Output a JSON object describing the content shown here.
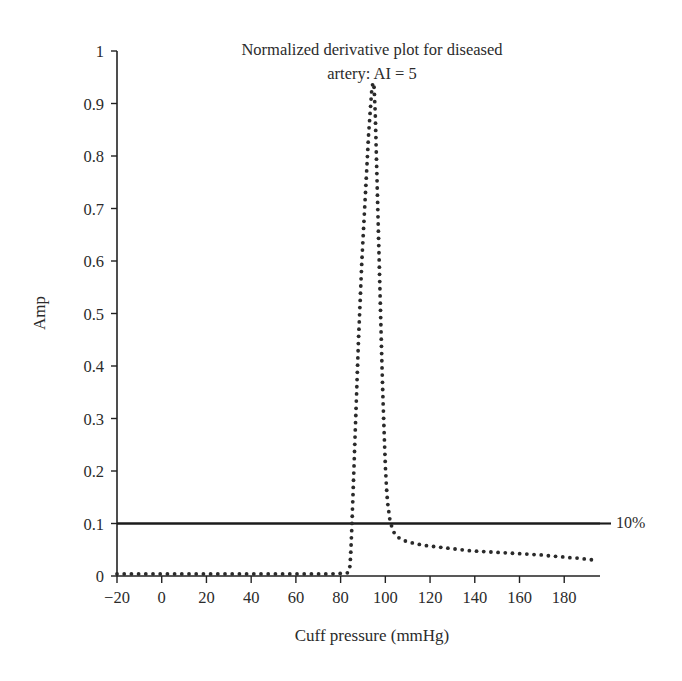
{
  "figure": {
    "background": "#ffffff",
    "ink_color": "#2b2b2b"
  },
  "title": {
    "line1": "Normalized derivative plot for diseased",
    "line2": "artery: AI = 5"
  },
  "axes": {
    "x_label": "Cuff pressure (mmHg)",
    "y_label": "Amp"
  },
  "annotation": {
    "threshold_label": "10%"
  },
  "chart_data": {
    "type": "line",
    "title": "Normalized derivative plot for diseased artery: AI = 5",
    "xlabel": "Cuff pressure (mmHg)",
    "ylabel": "Amp",
    "xlim": [
      -20,
      196
    ],
    "ylim": [
      0,
      1
    ],
    "xticks": [
      -20,
      0,
      20,
      40,
      60,
      80,
      100,
      120,
      140,
      160,
      180
    ],
    "xtick_labels": [
      "−20",
      "0",
      "20",
      "40",
      "60",
      "80",
      "100",
      "120",
      "140",
      "160",
      "180"
    ],
    "yticks": [
      0,
      0.1,
      0.2,
      0.3,
      0.4,
      0.5,
      0.6,
      0.7,
      0.8,
      0.9,
      1
    ],
    "ytick_labels": [
      "0",
      "0.1",
      "0.2",
      "0.3",
      "0.4",
      "0.5",
      "0.6",
      "0.7",
      "0.8",
      "0.9",
      "1"
    ],
    "grid": false,
    "legend": null,
    "series": [
      {
        "name": "normalized derivative",
        "style": "dotted",
        "color": "#2a2a2a",
        "x": [
          -20,
          -14,
          -8,
          -2,
          4,
          10,
          16,
          22,
          28,
          34,
          40,
          46,
          52,
          58,
          64,
          70,
          76,
          80,
          83,
          84,
          84.5,
          85,
          85.5,
          86,
          86.5,
          87,
          87.5,
          88,
          88.5,
          89,
          89.5,
          90,
          90.5,
          91,
          91.5,
          92,
          92.5,
          93,
          93.5,
          94,
          94.5,
          95,
          95.5,
          96,
          96.5,
          97,
          97.5,
          98,
          98.5,
          99,
          99.5,
          100,
          100.5,
          101,
          102,
          103,
          104,
          106,
          108,
          111,
          114,
          118,
          122,
          126,
          130,
          134,
          138,
          142,
          146,
          150,
          154,
          158,
          162,
          166,
          170,
          174,
          178,
          182,
          186,
          190,
          194
        ],
        "y": [
          0.004,
          0.004,
          0.004,
          0.004,
          0.004,
          0.004,
          0.004,
          0.004,
          0.004,
          0.004,
          0.004,
          0.004,
          0.004,
          0.004,
          0.004,
          0.004,
          0.004,
          0.005,
          0.006,
          0.01,
          0.04,
          0.09,
          0.15,
          0.21,
          0.27,
          0.33,
          0.39,
          0.45,
          0.5,
          0.55,
          0.6,
          0.64,
          0.68,
          0.72,
          0.76,
          0.8,
          0.84,
          0.87,
          0.9,
          0.93,
          0.94,
          0.93,
          0.88,
          0.8,
          0.72,
          0.64,
          0.56,
          0.48,
          0.4,
          0.33,
          0.27,
          0.21,
          0.17,
          0.14,
          0.108,
          0.092,
          0.082,
          0.073,
          0.068,
          0.064,
          0.061,
          0.058,
          0.056,
          0.054,
          0.052,
          0.05,
          0.048,
          0.047,
          0.046,
          0.045,
          0.044,
          0.043,
          0.042,
          0.041,
          0.04,
          0.038,
          0.037,
          0.035,
          0.034,
          0.032,
          0.03
        ]
      }
    ],
    "threshold": {
      "value": 0.1,
      "label": "10%",
      "style": "solid",
      "color": "#1b1b1b",
      "x_start": -20,
      "x_end": 196
    }
  }
}
